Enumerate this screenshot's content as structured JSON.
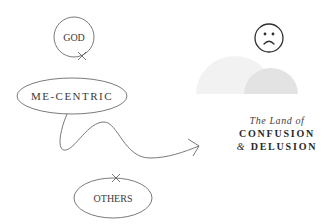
{
  "nodes": {
    "god": {
      "label": "GOD"
    },
    "me_centric": {
      "label": "ME-CENTRIC"
    },
    "others": {
      "label": "OTHERS"
    }
  },
  "destination": {
    "line1": "The Land of",
    "line2": "CONFUSION",
    "line3_amp": "&",
    "line3_word": " DELUSION"
  },
  "icons": {
    "face": "sad-face-icon",
    "hills": "hills-illustration",
    "arrow": "wavy-arrow"
  },
  "colors": {
    "stroke": "#6b6b6b",
    "text": "#3a3a3a",
    "hill_light": "#f1f1f1",
    "hill_dark": "#e2e2e2",
    "background": "#ffffff"
  }
}
